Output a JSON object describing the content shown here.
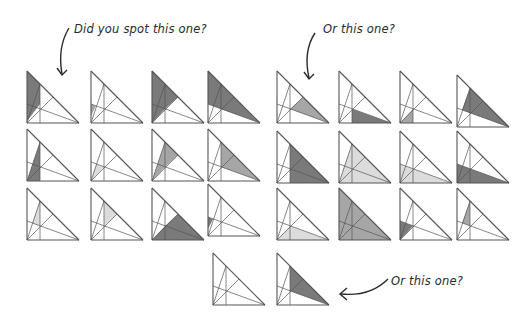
{
  "callouts": [
    {
      "id": "c1",
      "text": "Did you spot this one?",
      "x": 74,
      "y": 23
    },
    {
      "id": "c2",
      "text": "Or this one?",
      "x": 323,
      "y": 23
    },
    {
      "id": "c3",
      "text": "Or this one?",
      "x": 391,
      "y": 275
    }
  ],
  "colors": {
    "stroke": "#555555",
    "dark": "#7a7a7a",
    "mid": "#a6a6a6",
    "light": "#dcdcdc"
  },
  "triangles": [
    {
      "x": 26,
      "y": 70,
      "regions": [
        {
          "pts": [
            [
              0,
              0
            ],
            [
              13,
              13
            ],
            [
              13,
              33
            ],
            [
              0,
              50
            ]
          ],
          "shade": "dark"
        }
      ]
    },
    {
      "x": 90,
      "y": 70,
      "regions": [
        {
          "pts": [
            [
              0,
              33
            ],
            [
              5,
              35
            ],
            [
              0,
              45
            ]
          ],
          "shade": "mid"
        }
      ]
    },
    {
      "x": 151,
      "y": 70,
      "regions": [
        {
          "pts": [
            [
              0,
              0
            ],
            [
              26,
              26
            ],
            [
              13,
              38
            ],
            [
              0,
              52
            ]
          ],
          "shade": "dark"
        }
      ]
    },
    {
      "x": 207,
      "y": 70,
      "regions": [
        {
          "pts": [
            [
              0,
              0
            ],
            [
              52,
              52
            ],
            [
              13,
              38
            ],
            [
              0,
              33
            ]
          ],
          "shade": "dark"
        }
      ]
    },
    {
      "x": 276,
      "y": 70,
      "regions": [
        {
          "pts": [
            [
              26,
              26
            ],
            [
              52,
              52
            ],
            [
              13,
              38
            ]
          ],
          "shade": "mid"
        }
      ]
    },
    {
      "x": 338,
      "y": 70,
      "regions": [
        {
          "pts": [
            [
              13,
              38
            ],
            [
              52,
              52
            ],
            [
              13,
              52
            ]
          ],
          "shade": "dark"
        }
      ]
    },
    {
      "x": 399,
      "y": 70,
      "regions": [
        {
          "pts": [
            [
              0,
              52
            ],
            [
              13,
              38
            ],
            [
              13,
              52
            ]
          ],
          "shade": "mid"
        }
      ]
    },
    {
      "x": 456,
      "y": 74,
      "regions": [
        {
          "pts": [
            [
              13,
              13
            ],
            [
              52,
              52
            ],
            [
              13,
              38
            ],
            [
              5,
              35
            ]
          ],
          "shade": "dark"
        }
      ]
    },
    {
      "x": 26,
      "y": 128,
      "regions": [
        {
          "pts": [
            [
              13,
              13
            ],
            [
              13,
              52
            ],
            [
              0,
              52
            ]
          ],
          "shade": "dark"
        }
      ]
    },
    {
      "x": 90,
      "y": 128,
      "regions": [
        {
          "pts": [
            [
              5,
              35
            ],
            [
              13,
              38
            ],
            [
              0,
              52
            ]
          ],
          "shade": "light"
        }
      ]
    },
    {
      "x": 151,
      "y": 128,
      "regions": [
        {
          "pts": [
            [
              13,
              13
            ],
            [
              26,
              26
            ],
            [
              13,
              38
            ],
            [
              0,
              52
            ]
          ],
          "shade": "mid"
        }
      ]
    },
    {
      "x": 207,
      "y": 128,
      "regions": [
        {
          "pts": [
            [
              13,
              13
            ],
            [
              52,
              52
            ],
            [
              13,
              38
            ]
          ],
          "shade": "mid"
        }
      ]
    },
    {
      "x": 276,
      "y": 130,
      "regions": [
        {
          "pts": [
            [
              13,
              13
            ],
            [
              52,
              52
            ],
            [
              13,
              52
            ]
          ],
          "shade": "dark"
        }
      ]
    },
    {
      "x": 338,
      "y": 130,
      "regions": [
        {
          "pts": [
            [
              13,
              13
            ],
            [
              52,
              52
            ],
            [
              0,
              52
            ],
            [
              5,
              35
            ]
          ],
          "shade": "light"
        }
      ]
    },
    {
      "x": 399,
      "y": 130,
      "regions": [
        {
          "pts": [
            [
              0,
              33
            ],
            [
              52,
              52
            ],
            [
              0,
              52
            ]
          ],
          "shade": "light"
        }
      ]
    },
    {
      "x": 456,
      "y": 130,
      "regions": [
        {
          "pts": [
            [
              0,
              33
            ],
            [
              52,
              52
            ],
            [
              0,
              52
            ]
          ],
          "shade": "dark"
        }
      ]
    },
    {
      "x": 26,
      "y": 187,
      "regions": [
        {
          "pts": [
            [
              5,
              35
            ],
            [
              13,
              13
            ],
            [
              13,
              38
            ]
          ],
          "shade": "light"
        }
      ]
    },
    {
      "x": 90,
      "y": 187,
      "regions": [
        {
          "pts": [
            [
              13,
              13
            ],
            [
              26,
              26
            ],
            [
              13,
              38
            ]
          ],
          "shade": "light"
        }
      ]
    },
    {
      "x": 151,
      "y": 187,
      "regions": [
        {
          "pts": [
            [
              26,
              26
            ],
            [
              52,
              52
            ],
            [
              0,
              52
            ],
            [
              13,
              38
            ]
          ],
          "shade": "dark"
        }
      ]
    },
    {
      "x": 207,
      "y": 183,
      "regions": [
        {
          "pts": [
            [
              0,
              33
            ],
            [
              5,
              35
            ],
            [
              0,
              45
            ]
          ],
          "shade": "dark"
        }
      ]
    },
    {
      "x": 276,
      "y": 187,
      "regions": [
        {
          "pts": [
            [
              13,
              38
            ],
            [
              52,
              52
            ],
            [
              0,
              52
            ]
          ],
          "shade": "light"
        }
      ]
    },
    {
      "x": 338,
      "y": 187,
      "regions": [
        {
          "pts": [
            [
              0,
              0
            ],
            [
              52,
              52
            ],
            [
              0,
              52
            ]
          ],
          "shade": "mid"
        }
      ]
    },
    {
      "x": 399,
      "y": 187,
      "regions": [
        {
          "pts": [
            [
              0,
              33
            ],
            [
              13,
              38
            ],
            [
              0,
              52
            ]
          ],
          "shade": "dark"
        }
      ]
    },
    {
      "x": 456,
      "y": 187,
      "regions": [
        {
          "pts": [
            [
              13,
              13
            ],
            [
              13,
              38
            ],
            [
              5,
              35
            ]
          ],
          "shade": "mid"
        }
      ]
    },
    {
      "x": 212,
      "y": 252,
      "regions": []
    },
    {
      "x": 276,
      "y": 252,
      "regions": [
        {
          "pts": [
            [
              13,
              13
            ],
            [
              52,
              52
            ],
            [
              13,
              38
            ]
          ],
          "shade": "dark"
        }
      ]
    }
  ]
}
